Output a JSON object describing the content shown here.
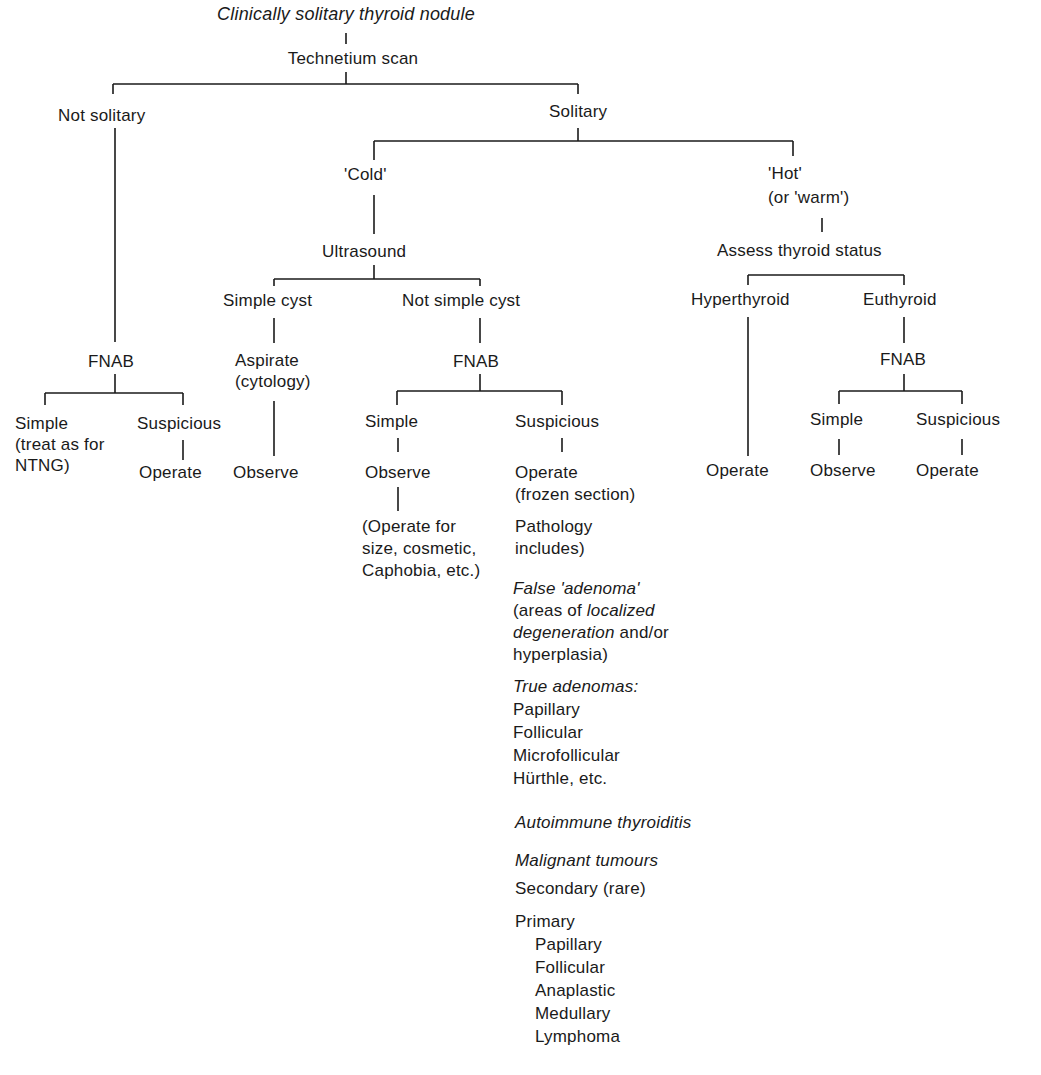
{
  "diagram": {
    "title": "Clinically solitary thyroid nodule",
    "scan": "Technetium scan",
    "not_solitary": {
      "label": "Not solitary",
      "fnab": "FNAB",
      "simple": [
        "Simple",
        "(treat as for",
        "NTNG)"
      ],
      "suspicious": "Suspicious",
      "operate": "Operate"
    },
    "solitary": {
      "label": "Solitary",
      "cold": {
        "label": "'Cold'",
        "ultrasound": "Ultrasound",
        "simple_cyst": {
          "label": "Simple cyst",
          "aspirate": [
            "Aspirate",
            "(cytology)"
          ],
          "observe": "Observe"
        },
        "not_simple_cyst": {
          "label": "Not simple cyst",
          "fnab": "FNAB",
          "simple": {
            "label": "Simple",
            "observe": "Observe",
            "note": [
              "(Operate for",
              "size, cosmetic,",
              "Caphobia, etc.)"
            ]
          },
          "suspicious": {
            "label": "Suspicious",
            "operate": [
              "Operate",
              "(frozen section)"
            ],
            "pathology": [
              "Pathology",
              "includes)"
            ],
            "false_adenoma": {
              "heading": "False 'adenoma'",
              "line1_pre": "(areas of ",
              "line1_it": "localized",
              "line2_it": "degeneration",
              "line2_post": " and/or",
              "line3": "hyperplasia)"
            },
            "true_adenomas": {
              "heading": "True adenomas:",
              "items": [
                "Papillary",
                "Follicular",
                "Microfollicular",
                "Hürthle, etc."
              ]
            },
            "autoimmune": "Autoimmune thyroiditis",
            "malignant": {
              "heading": "Malignant tumours",
              "secondary": "Secondary (rare)",
              "primary": "Primary",
              "primary_items": [
                "Papillary",
                "Follicular",
                "Anaplastic",
                "Medullary",
                "Lymphoma"
              ]
            }
          }
        }
      },
      "hot": {
        "label": [
          "'Hot'",
          "(or 'warm')"
        ],
        "assess": "Assess thyroid status",
        "hyperthyroid": {
          "label": "Hyperthyroid",
          "operate": "Operate"
        },
        "euthyroid": {
          "label": "Euthyroid",
          "fnab": "FNAB",
          "simple": "Simple",
          "observe": "Observe",
          "suspicious": "Suspicious",
          "operate": "Operate"
        }
      }
    }
  }
}
